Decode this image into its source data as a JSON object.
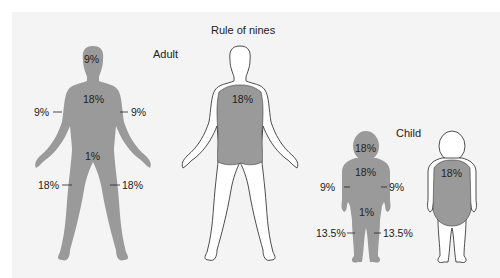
{
  "title": "Rule of nines",
  "colors": {
    "fill": "#9a9a9a",
    "outline": "#3a3a3a",
    "background": "#f4f4f4",
    "border": "#ffffff"
  },
  "adult": {
    "label": "Adult",
    "front": {
      "head": "9%",
      "trunk_front": "18%",
      "left_arm": "9%",
      "right_arm": "9%",
      "genitals": "1%",
      "left_leg": "18%",
      "right_leg": "18%"
    },
    "back": {
      "trunk_back": "18%"
    }
  },
  "child": {
    "label": "Child",
    "front": {
      "head": "18%",
      "trunk_front": "18%",
      "left_arm": "9%",
      "right_arm": "9%",
      "genitals": "1%",
      "left_leg": "13.5%",
      "right_leg": "13.5%"
    },
    "back": {
      "trunk_back": "18%"
    }
  }
}
